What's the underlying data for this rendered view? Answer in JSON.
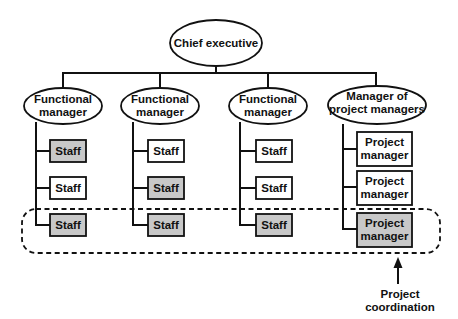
{
  "diagram": {
    "type": "org-chart",
    "colors": {
      "highlight_fill": "#c8c8c8",
      "box_fill": "#ffffff",
      "line": "#111111"
    },
    "root": {
      "label": "Chief executive"
    },
    "columns": [
      {
        "manager": {
          "line1": "Functional",
          "line2": "manager"
        },
        "children": [
          {
            "label": "Staff",
            "highlighted": true
          },
          {
            "label": "Staff",
            "highlighted": false
          },
          {
            "label": "Staff",
            "highlighted": true
          }
        ]
      },
      {
        "manager": {
          "line1": "Functional",
          "line2": "manager"
        },
        "children": [
          {
            "label": "Staff",
            "highlighted": false
          },
          {
            "label": "Staff",
            "highlighted": true
          },
          {
            "label": "Staff",
            "highlighted": true
          }
        ]
      },
      {
        "manager": {
          "line1": "Functional",
          "line2": "manager"
        },
        "children": [
          {
            "label": "Staff",
            "highlighted": false
          },
          {
            "label": "Staff",
            "highlighted": false
          },
          {
            "label": "Staff",
            "highlighted": true
          }
        ]
      },
      {
        "manager": {
          "line1": "Manager of",
          "line2": "project managers"
        },
        "children": [
          {
            "line1": "Project",
            "line2": "manager",
            "highlighted": false
          },
          {
            "line1": "Project",
            "line2": "manager",
            "highlighted": false
          },
          {
            "line1": "Project",
            "line2": "manager",
            "highlighted": true
          }
        ]
      }
    ],
    "annotation": {
      "line1": "Project",
      "line2": "coordination"
    }
  }
}
